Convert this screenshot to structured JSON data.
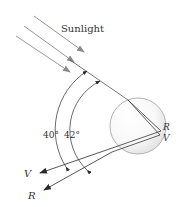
{
  "figure": {
    "title_label": "Sunlight",
    "angle_labels": [
      "40°",
      "42°"
    ],
    "back_labels": {
      "red": "R",
      "violet": "V"
    },
    "exit_labels": {
      "violet": "V",
      "red": "R"
    },
    "colors": {
      "sun_ray": "#8a8a8a",
      "ray": "#3a3a3a",
      "drop_edge": "#9a9a9a",
      "drop_fill": "#ebebeb",
      "text": "#333333"
    }
  }
}
